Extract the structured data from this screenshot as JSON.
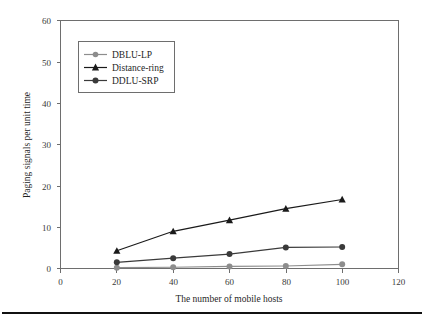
{
  "chart_data": {
    "type": "line",
    "title": "",
    "xlabel": "The number of mobile hosts",
    "ylabel": "Paging signals per unit time",
    "x": [
      20,
      40,
      60,
      80,
      100
    ],
    "xlim": [
      0,
      120
    ],
    "ylim": [
      0,
      60
    ],
    "xticks": [
      0,
      20,
      40,
      60,
      80,
      100,
      120
    ],
    "yticks": [
      0,
      10,
      20,
      30,
      40,
      50,
      60
    ],
    "xtick_labels": [
      "0",
      "20",
      "40",
      "60",
      "80",
      "100",
      "120"
    ],
    "ytick_labels": [
      "0",
      "10",
      "20",
      "30",
      "40",
      "50",
      "60"
    ],
    "grid": false,
    "legend_position": "upper-left",
    "series": [
      {
        "name": "DBLU-LP",
        "values": [
          0.2,
          0.3,
          0.5,
          0.6,
          1.0
        ],
        "color": "#8d8d8d",
        "marker": "circle"
      },
      {
        "name": "Distance-ring",
        "values": [
          4.3,
          9.0,
          11.7,
          14.5,
          16.7
        ],
        "color": "#1a1a1a",
        "marker": "triangle"
      },
      {
        "name": "DDLU-SRP",
        "values": [
          1.5,
          2.5,
          3.5,
          5.1,
          5.2
        ],
        "color": "#3a3a3a",
        "marker": "circle"
      }
    ]
  },
  "legend": {
    "entries": [
      {
        "label": "DBLU-LP"
      },
      {
        "label": "Distance-ring"
      },
      {
        "label": "DDLU-SRP"
      }
    ]
  },
  "axes": {
    "x_title": "The number of mobile hosts",
    "y_title": "Paging signals per unit time",
    "x_ticks": [
      "0",
      "20",
      "40",
      "60",
      "80",
      "100",
      "120"
    ],
    "y_ticks": [
      "0",
      "10",
      "20",
      "30",
      "40",
      "50",
      "60"
    ]
  },
  "colors": {
    "axis": "#6e6e6e",
    "series_light": "#8d8d8d",
    "series_dark": "#1a1a1a",
    "series_mid": "#3a3a3a",
    "rule": "#111111"
  }
}
